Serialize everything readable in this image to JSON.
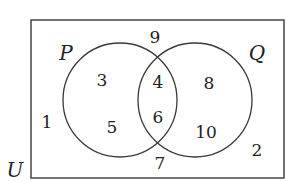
{
  "diagram": {
    "type": "venn",
    "universe_label": "U",
    "sets": [
      {
        "label": "P",
        "only": "3, 5"
      },
      {
        "label": "Q",
        "only": "8, 10"
      }
    ],
    "regions": {
      "p_only": [
        "3",
        "5"
      ],
      "intersection": [
        "4",
        "6"
      ],
      "q_only": [
        "8",
        "10"
      ],
      "outside": [
        "9",
        "1",
        "7",
        "2"
      ]
    },
    "text": {
      "p_label": "P",
      "q_label": "Q",
      "u_label": "U",
      "n3": "3",
      "n5": "5",
      "n4": "4",
      "n6": "6",
      "n8": "8",
      "n10": "10",
      "n9": "9",
      "n1": "1",
      "n7": "7",
      "n2": "2"
    },
    "colors": {
      "stroke": "#3a3a3a",
      "text": "#222222",
      "background": "#ffffff"
    }
  }
}
